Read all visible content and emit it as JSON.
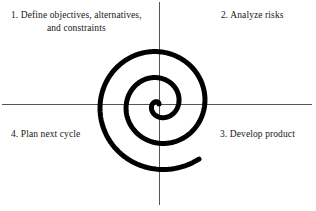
{
  "diagram": {
    "name": "spiral-model",
    "background_color": "#ffffff",
    "axis_color": "#4a4a4a",
    "spiral_color": "#000000",
    "text_color": "#161616",
    "axes": {
      "center_x": 159,
      "center_y": 104,
      "horizontal": {
        "x_start": 2,
        "x_end": 312,
        "y": 104,
        "width": 1
      },
      "vertical": {
        "y_start": 2,
        "y_end": 205,
        "x": 159,
        "width": 1
      }
    },
    "spiral": {
      "type": "archimedean",
      "turns": 2.6,
      "stroke_width": 5,
      "center_x": 159,
      "center_y": 104,
      "max_radius": 68,
      "start_angle_deg": 0,
      "end_point": {
        "x": 228,
        "y": 67
      },
      "leftmost_x": 104,
      "bottom_y": 150,
      "top_y": 35
    }
  },
  "quadrants": {
    "q1": {
      "name": "define-objectives",
      "number": "1.",
      "line1": "1. Define objectives, alternatives,",
      "line2": "and constraints",
      "full_text": "1. Define objectives, alternatives, and constraints",
      "position": "top-left"
    },
    "q2": {
      "name": "analyze-risks",
      "number": "2.",
      "text": "2. Analyze risks",
      "position": "top-right"
    },
    "q3": {
      "name": "develop-product",
      "number": "3.",
      "text": "3. Develop product",
      "position": "bottom-right"
    },
    "q4": {
      "name": "plan-next-cycle",
      "number": "4.",
      "text": "4. Plan next cycle",
      "position": "bottom-left"
    }
  }
}
